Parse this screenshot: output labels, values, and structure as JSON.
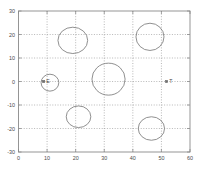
{
  "chart_data": {
    "type": "scatter",
    "title": "",
    "xlabel": "",
    "ylabel": "",
    "xlim": [
      0,
      60
    ],
    "ylim": [
      -30,
      30
    ],
    "grid": true,
    "legend_position": "none",
    "xticks": [
      0,
      10,
      20,
      30,
      40,
      50,
      60
    ],
    "xtick_labels": [
      "0",
      "10",
      "20",
      "30",
      "40",
      "50",
      "60"
    ],
    "yticks": [
      -30,
      -20,
      -10,
      0,
      10,
      20,
      30
    ],
    "ytick_labels": [
      "-30",
      "-20",
      "-10",
      "0",
      "10",
      "20",
      "30"
    ],
    "ellipses": [
      {
        "name": "ellipse-top-left",
        "cx": 19.0,
        "cy": 17.5,
        "rx": 5.2,
        "ry": 5.6
      },
      {
        "name": "ellipse-top-right",
        "cx": 46.0,
        "cy": 19.0,
        "rx": 4.9,
        "ry": 5.8
      },
      {
        "name": "ellipse-center",
        "cx": 31.5,
        "cy": 1.0,
        "rx": 5.8,
        "ry": 6.8
      },
      {
        "name": "ellipse-left-small",
        "cx": 11.0,
        "cy": -0.5,
        "rx": 3.1,
        "ry": 3.6
      },
      {
        "name": "ellipse-bottom-left",
        "cx": 21.0,
        "cy": -15.0,
        "rx": 4.3,
        "ry": 4.6
      },
      {
        "name": "ellipse-bottom-right",
        "cx": 46.5,
        "cy": -20.0,
        "rx": 4.6,
        "ry": 5.0
      }
    ],
    "point_markers": [
      {
        "name": "marker-E",
        "x": 8.8,
        "y": 0,
        "label": "E"
      },
      {
        "name": "marker-T",
        "x": 51.8,
        "y": 0,
        "label": "T"
      }
    ]
  }
}
